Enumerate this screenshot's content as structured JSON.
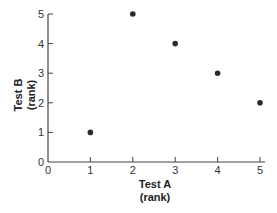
{
  "chart_data": {
    "type": "scatter",
    "title": "",
    "xlabel": "Test A",
    "xlabel_sub": "(rank)",
    "ylabel": "Test B",
    "ylabel_sub": "(rank)",
    "xlim": [
      0,
      5
    ],
    "ylim": [
      0,
      5
    ],
    "xticks": [
      "0",
      "1",
      "2",
      "3",
      "4",
      "5"
    ],
    "yticks": [
      "0",
      "1",
      "2",
      "3",
      "4",
      "5"
    ],
    "grid": false,
    "legend": null,
    "series": [
      {
        "name": "ranks",
        "x": [
          1,
          2,
          3,
          4,
          5
        ],
        "y": [
          1,
          5,
          4,
          3,
          2
        ]
      }
    ],
    "point_color": "#2a2a2a",
    "axis_color": "#444444"
  }
}
